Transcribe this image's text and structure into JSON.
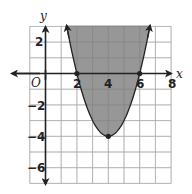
{
  "chart_data": {
    "type": "area",
    "title": "",
    "function": "y = (x - 4)^2 - 4",
    "inequality": "y >= x^2 - 8x + 12",
    "vertex": [
      4,
      -4
    ],
    "roots": [
      2,
      6
    ],
    "shaded_region": "above",
    "boundary": "solid",
    "xlabel": "x",
    "ylabel": "y",
    "origin_label": "O",
    "xlim": [
      -1,
      8
    ],
    "ylim": [
      -7,
      3
    ],
    "x_ticks": [
      2,
      4,
      6,
      8
    ],
    "y_ticks": [
      2,
      -2,
      -4,
      -6
    ],
    "x_tick_labels": [
      "2",
      "4",
      "6",
      "8"
    ],
    "y_tick_labels": [
      "2",
      "−2",
      "−4",
      "−6"
    ],
    "marked_points": [
      [
        2,
        0
      ],
      [
        6,
        0
      ],
      [
        4,
        -4
      ]
    ],
    "grid": true,
    "colors": {
      "shade": "#8c8c8c",
      "curve": "#222222",
      "grid": "#cfcfcf",
      "axis": "#222222"
    }
  }
}
